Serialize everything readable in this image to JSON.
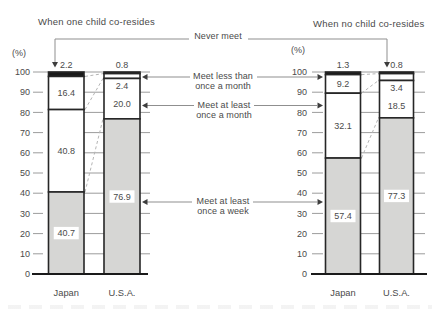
{
  "header": {
    "left_title": "When one child co-resides",
    "right_title": "When no child co-resides"
  },
  "legend": {
    "never_meet": "Never meet",
    "meet_less_line1": "Meet less than",
    "meet_less_line2": "once a month",
    "meet_month_line1": "Meet at least",
    "meet_month_line2": "once a month",
    "meet_week_line1": "Meet at least",
    "meet_week_line2": "once a week"
  },
  "axis": {
    "unit": "(%)",
    "ticks": [
      0,
      10,
      20,
      30,
      40,
      50,
      60,
      70,
      80,
      90,
      100
    ]
  },
  "chart_data": {
    "type": "bar",
    "subtype": "stacked-percentage-column",
    "ylim": [
      0,
      100
    ],
    "ylabel": "(%)",
    "grid": true,
    "segment_order_top_to_bottom": [
      "Never meet",
      "Meet less than once a month",
      "Meet at least once a month",
      "Meet at least once a week"
    ],
    "segment_fill_styles_top_to_bottom": [
      "black",
      "white",
      "white",
      "gray"
    ],
    "groups": [
      {
        "title": "When one child co-resides",
        "bars": [
          {
            "category": "Japan",
            "segments": [
              2.2,
              16.4,
              40.8,
              40.7
            ]
          },
          {
            "category": "U.S.A.",
            "segments": [
              0.8,
              2.4,
              20.0,
              76.9
            ]
          }
        ]
      },
      {
        "title": "When no child co-resides",
        "bars": [
          {
            "category": "Japan",
            "segments": [
              1.3,
              9.2,
              32.1,
              57.4
            ]
          },
          {
            "category": "U.S.A.",
            "segments": [
              0.8,
              3.4,
              18.5,
              77.3
            ]
          }
        ]
      }
    ]
  },
  "colors": {
    "bar_black": "#1a1a1a",
    "bar_white": "#ffffff",
    "bar_gray": "#d6d6d4",
    "bar_border": "#262626",
    "grid": "#9c9c9c",
    "baseline": "#1a1a1a",
    "text": "#4a4a4a",
    "callout_line": "#8f8f8f",
    "arrow": "#3d3d3d",
    "dashed_connector": "#b5b5b5"
  }
}
